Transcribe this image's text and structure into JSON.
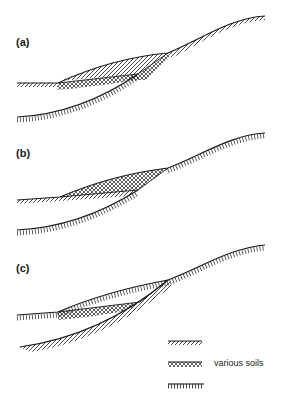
{
  "figure": {
    "panels": [
      {
        "id": "a",
        "label": "(a)"
      },
      {
        "id": "b",
        "label": "(b)"
      },
      {
        "id": "c",
        "label": "(c)"
      }
    ],
    "legend": {
      "items": [
        {
          "pattern": "diagonal-hatch",
          "label": ""
        },
        {
          "pattern": "crosshatch",
          "label": "various soils"
        },
        {
          "pattern": "vertical-ticks",
          "label": ""
        }
      ]
    },
    "colors": {
      "ink": "#1a1a1a",
      "background": "#ffffff"
    }
  }
}
